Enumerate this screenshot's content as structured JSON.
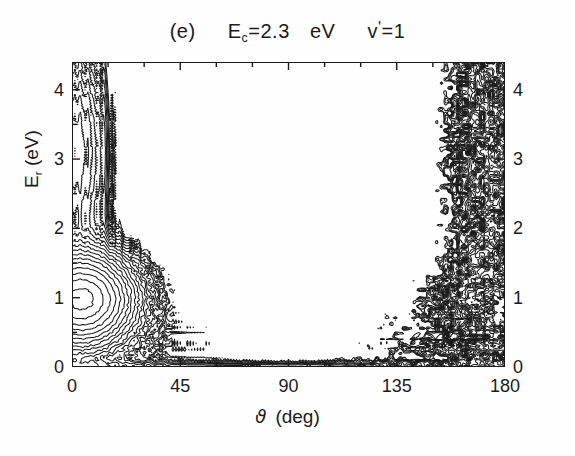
{
  "figure": {
    "panel_label": "(e)",
    "title_energy_symbol": "E",
    "title_energy_subscript": "c",
    "title_energy_eq": "=2.3",
    "title_energy_unit": "eV",
    "title_vib_symbol": "v",
    "title_vib_prime": "'",
    "title_vib_eq": "=1",
    "line_color": "#1a1a1a",
    "background_color": "#fefefe"
  },
  "axes": {
    "x_label_symbol": "ϑ",
    "x_label_unit": "(deg)",
    "y_label_symbol": "E",
    "y_label_subscript": "r",
    "y_label_unit": "(eV)",
    "x_ticks": [
      "0",
      "45",
      "90",
      "135",
      "180"
    ],
    "y_ticks_left": [
      "0",
      "1",
      "2",
      "3",
      "4"
    ],
    "y_ticks_right": [
      "0",
      "1",
      "2",
      "3",
      "4"
    ]
  },
  "chart_data": {
    "type": "contour",
    "xlabel": "ϑ (deg)",
    "ylabel": "E_r (eV)",
    "xlim": [
      0,
      180
    ],
    "ylim": [
      0,
      4.4
    ],
    "xticks": [
      0,
      45,
      90,
      135,
      180
    ],
    "yticks": [
      0,
      1,
      2,
      3,
      4
    ],
    "xtick_minor_step": 15,
    "ytick_minor_step": 0.5,
    "grid": false,
    "legend": false,
    "n_levels": 20,
    "level_min": 0.04,
    "level_max": 0.97,
    "level_spacing": "linear",
    "peaks": [
      {
        "name": "forward-lobe",
        "theta_deg": 4,
        "Er_eV": 1.0,
        "amplitude": 1.0,
        "sigma_theta_deg": 13,
        "sigma_Er_eV": 0.42,
        "character": "smooth"
      },
      {
        "name": "backward-lobe",
        "theta_deg": 179,
        "Er_eV": 0.9,
        "amplitude": 0.93,
        "sigma_theta_deg": 11,
        "sigma_Er_eV": 0.4,
        "character": "oscillatory"
      },
      {
        "name": "forward-tail-high-Er",
        "theta_deg": 2,
        "Er_eV": 3.1,
        "amplitude": 0.2,
        "sigma_theta_deg": 9,
        "sigma_Er_eV": 1.0,
        "character": "smooth"
      },
      {
        "name": "backward-tail-high-Er",
        "theta_deg": 176,
        "Er_eV": 3.2,
        "amplitude": 0.22,
        "sigma_theta_deg": 12,
        "sigma_Er_eV": 1.1,
        "character": "oscillatory"
      },
      {
        "name": "low-Er-ridge",
        "theta_deg": 90,
        "Er_eV": 0.06,
        "amplitude": 0.07,
        "sigma_theta_deg": 95,
        "sigma_Er_eV": 0.1,
        "character": "thin-band"
      }
    ],
    "valley": {
      "theta_deg_range": [
        70,
        115
      ],
      "Er_eV_max_extent": 1.6
    },
    "noise": {
      "region_theta_deg": [
        115,
        180
      ],
      "relative_amplitude": 0.23,
      "granularity_deg": 4.2
    }
  }
}
